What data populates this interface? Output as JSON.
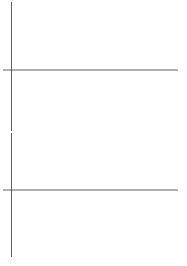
{
  "figure": {
    "title": "",
    "background_color": "#ffffff",
    "trace_color": "#4a4a4a",
    "axis_color": "#3a3a3a",
    "width": 187,
    "height": 266,
    "panel_count": 2
  },
  "panels": [
    {
      "name": "top-waveform",
      "label": "",
      "description": "high-frequency oscillating waveform"
    },
    {
      "name": "bottom-waveform",
      "label": "",
      "description": "amplitude-modulated beat waveform with nodes"
    }
  ],
  "chart_data": [
    {
      "type": "line",
      "name": "top-waveform",
      "title": "",
      "xlabel": "",
      "ylabel": "",
      "xlim": [
        0,
        1
      ],
      "ylim": [
        -1.05,
        1.05
      ],
      "grid": false,
      "legend": null,
      "axis_y_value": 0,
      "axis_x_value": 0.018,
      "series": [
        {
          "name": "carrier",
          "formula": "cos(2*pi*11.5*x) * (0.93 + 0.07*cos(2*pi*2*x))",
          "n_cycles": 23,
          "amplitude": 1.0,
          "samples": 1400
        },
        {
          "name": "carrier-beat",
          "formula": "cos(2*pi*12.5*x + 0.35) * (0.93 + 0.07*cos(2*pi*2*x))",
          "n_cycles": 25,
          "amplitude": 1.0,
          "samples": 1400
        }
      ]
    },
    {
      "type": "line",
      "name": "bottom-waveform",
      "title": "",
      "xlabel": "",
      "ylabel": "",
      "xlim": [
        0,
        1
      ],
      "ylim": [
        -1.05,
        1.05
      ],
      "grid": false,
      "legend": null,
      "axis_y_value": 0,
      "axis_x_value": 0.018,
      "series": [
        {
          "name": "modulated",
          "formula": "cos(2*pi*7.5*x) * cos(2*pi*1.25*x - 0.35)",
          "n_cycles": 15,
          "beat_nodes": 2,
          "amplitude": 1.0,
          "samples": 1400
        }
      ]
    }
  ]
}
